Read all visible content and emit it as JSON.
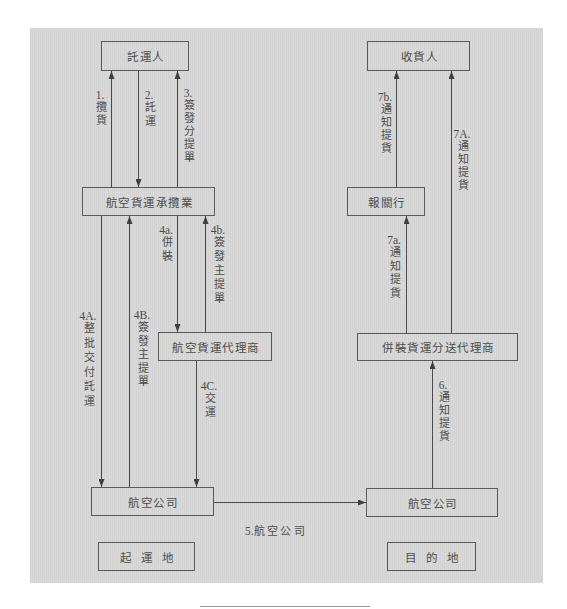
{
  "nodes": {
    "shipper": {
      "label": "託運人"
    },
    "consignee": {
      "label": "收貨人"
    },
    "forwarder": {
      "label": "航空貨運承攬業"
    },
    "customs_broker": {
      "label": "報關行"
    },
    "air_cargo_agent": {
      "label": "航空貨運代理商"
    },
    "consolidation_agent": {
      "label": "併裝貨運分送代理商"
    },
    "airline_origin": {
      "label": "航空公司"
    },
    "airline_destination": {
      "label": "航空公司"
    }
  },
  "regions": {
    "origin": "起運地",
    "destination": "目的地"
  },
  "edges": [
    {
      "number": "1.",
      "label": "攬貨",
      "from": "forwarder",
      "to": "shipper"
    },
    {
      "number": "2.",
      "label": "託運",
      "from": "shipper",
      "to": "forwarder"
    },
    {
      "number": "3.",
      "label": "簽發分提單",
      "from": "forwarder",
      "to": "shipper"
    },
    {
      "number": "4a.",
      "label": "併裝",
      "from": "forwarder",
      "to": "air_cargo_agent"
    },
    {
      "number": "4b.",
      "label": "簽發主提單",
      "from": "air_cargo_agent",
      "to": "forwarder"
    },
    {
      "number": "4A.",
      "label": "整批交付託運",
      "from": "forwarder",
      "to": "airline_origin"
    },
    {
      "number": "4B.",
      "label": "簽發主提單",
      "from": "airline_origin",
      "to": "forwarder"
    },
    {
      "number": "4C.",
      "label": "交運",
      "from": "air_cargo_agent",
      "to": "airline_origin"
    },
    {
      "number": "5.",
      "label": "航空公司",
      "from": "airline_origin",
      "to": "airline_destination"
    },
    {
      "number": "6.",
      "label": "通知提貨",
      "from": "airline_destination",
      "to": "consolidation_agent"
    },
    {
      "number": "7a.",
      "label": "通知提貨",
      "from": "consolidation_agent",
      "to": "customs_broker"
    },
    {
      "number": "7b.",
      "label": "通知提貨",
      "from": "customs_broker",
      "to": "consignee"
    },
    {
      "number": "7A.",
      "label": "通知提貨",
      "from": "consolidation_agent",
      "to": "consignee"
    }
  ],
  "colors": {
    "panel": "#d6d6d6",
    "line": "#4a4a4a",
    "text": "#4d4d4d"
  }
}
